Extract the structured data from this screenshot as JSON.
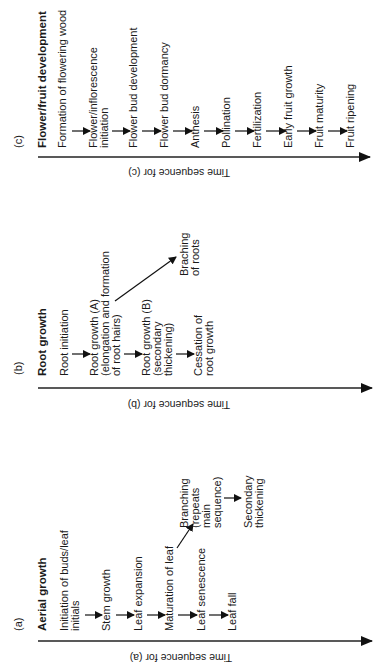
{
  "panels": {
    "c": {
      "label": "(c)",
      "title": "Flower/fruit development",
      "axis_label": "Time sequence for (c)",
      "items": [
        "Formation of flowering wood",
        [
          "Flower/inflorescence",
          "initiation"
        ],
        "Flower bud development",
        "Flower bud dormancy",
        "Anthesis",
        "Pollination",
        "Fertilization",
        "Early fruit growth",
        "Fruit maturity",
        "Fruit ripening"
      ],
      "i0": "Formation of flowering wood",
      "i1a": "Flower/inflorescence",
      "i1b": "initiation",
      "i2": "Flower bud development",
      "i3": "Flower bud dormancy",
      "i4": "Anthesis",
      "i5": "Pollination",
      "i6": "Fertilization",
      "i7": "Early fruit growth",
      "i8": "Fruit maturity",
      "i9": "Fruit ripening"
    },
    "b": {
      "label": "(b)",
      "title": "Root growth",
      "axis_label": "Time sequence for (b)",
      "i0": "Root initiation",
      "i1a": "Root growth (A)",
      "i1b": "(elongation and formation",
      "i1c": "of root hairs)",
      "i2a": "Root growth (B)",
      "i2b": "(secondary",
      "i2c": "thickening)",
      "i3a": "Cessation of",
      "i3b": "root growth",
      "branch_a": "Braching",
      "branch_b": "of roots"
    },
    "a": {
      "label": "(a)",
      "title": "Aerial growth",
      "axis_label": "Time sequence for (a)",
      "i0a": "Initiation of buds/leaf",
      "i0b": "initials",
      "i1": "Stem growth",
      "i2": "Leaf expansion",
      "i3": "Maturation of leaf",
      "i4": "Leaf senescence",
      "i5": "Leaf fall",
      "branch_a": "Branching",
      "branch_b": "(repeats",
      "branch_c": "main",
      "branch_d": "sequence)",
      "sec_a": "Secondary",
      "sec_b": "thickening"
    }
  }
}
